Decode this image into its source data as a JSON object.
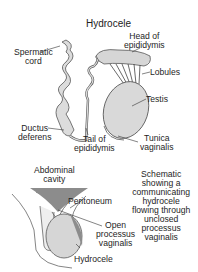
{
  "title": "Hydrocele",
  "top_diagram": {
    "labels": {
      "spermatic_cord": [
        "Spermatic",
        "cord"
      ],
      "head_of_epididymis": [
        "Head of",
        "epididymis"
      ],
      "lobules": "Lobules",
      "testis": "Testis",
      "ductus_deferens": [
        "Ductus",
        "deferens"
      ],
      "tail_of_epididymis": [
        "Tail of",
        "epididymis"
      ],
      "tunica_vaginalis": [
        "Tunica",
        "vaginalis"
      ]
    }
  },
  "bottom_diagram": {
    "labels": {
      "abdominal_cavity": [
        "Abdominal",
        "cavity"
      ],
      "peritoneum": "Peritoneum",
      "open_processus_vaginalis": [
        "Open",
        "processus",
        "vaginalis"
      ],
      "hydrocele": "Hydrocele"
    },
    "caption": [
      "Schematic",
      "showing a",
      "communicating",
      "hydrocele",
      "flowing through",
      "unclosed",
      "processus",
      "vaginalis"
    ]
  },
  "colors": {
    "fill_light": "#d9d9d9",
    "fill_dark": "#8c8c8c",
    "stroke": "#555555"
  }
}
